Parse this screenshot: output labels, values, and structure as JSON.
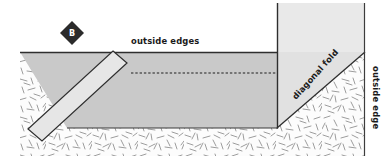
{
  "figure": {
    "step_badge": {
      "letter": "B",
      "shape": "diamond",
      "fill_color": "#2b2b2b",
      "text_color": "#ffffff",
      "center_x": 72,
      "center_y": 33,
      "radius": 12
    },
    "labels": [
      {
        "name": "outside-edges-label",
        "text": "outside edges",
        "x": 131,
        "y": 44,
        "rotation": 0,
        "anchor": "start"
      },
      {
        "name": "diagonal-fold-label",
        "text": "diagonal fold",
        "x": 296,
        "y": 100,
        "rotation": -48,
        "anchor": "start"
      },
      {
        "name": "outside-edge-label",
        "text": "outside edge",
        "x": 365,
        "y": 66,
        "rotation": 90,
        "anchor": "start"
      }
    ],
    "colors": {
      "background": "#ffffff",
      "texture_field": "#fbfbfb",
      "texture_stroke": "#8f8f8f",
      "main_band_fill": "#c9c9c9",
      "upper_panel_fill": "#e9e9e9",
      "strip_fill": "#e3e3e3",
      "outline": "#2e2e2e",
      "dash_line": "#1f1f1f"
    },
    "shapes": {
      "texture_field": {
        "name": "fabric-texture-field",
        "x": 20,
        "y": 52,
        "width": 345,
        "height": 104
      },
      "main_band": {
        "name": "main-fabric-band",
        "points": "20,52 277,52 277,128 67,128",
        "description": "horizontal mid-gray fabric band"
      },
      "upper_panel": {
        "name": "upper-fabric-panel",
        "points": "277,3 365,3 365,52 277,52",
        "description": "light panel above band at right"
      },
      "diagonal_panel": {
        "name": "diagonal-fold-panel",
        "points": "277,52 365,52 365,3 277,3",
        "description": "panel whose lower-right edge is the diagonal fold"
      },
      "diagonal_fold_line": {
        "name": "diagonal-fold-line",
        "x1": 277,
        "y1": 128,
        "x2": 365,
        "y2": 52
      },
      "strip": {
        "name": "diagonal-binding-strip",
        "points": "113,51 126,62 41,140 28,129",
        "description": "light diagonal strip laid across lower-left"
      },
      "dashed_line": {
        "name": "fold-guide-dashed-line",
        "x1": 131,
        "y1": 73,
        "x2": 277,
        "y2": 73
      },
      "top_edge_line": {
        "name": "top-outside-edge-line",
        "x1": 20,
        "y1": 52,
        "x2": 277,
        "y2": 52
      },
      "right_vertical_line": {
        "name": "right-outside-edge-line",
        "x1": 365,
        "y1": 3,
        "x2": 365,
        "y2": 156
      },
      "corner_vertical_line": {
        "name": "corner-vertical-line",
        "x1": 277,
        "y1": 3,
        "x2": 277,
        "y2": 128
      },
      "band_bottom_line": {
        "name": "band-bottom-edge-line",
        "x1": 67,
        "y1": 128,
        "x2": 277,
        "y2": 128
      }
    }
  }
}
